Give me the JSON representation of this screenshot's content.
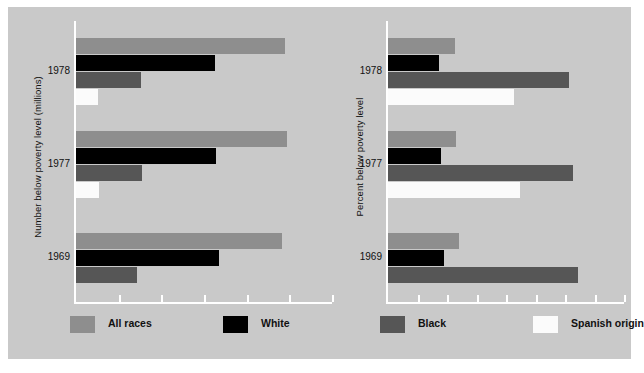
{
  "figure": {
    "background_color": "#c9c9c9",
    "border_color": "#ffffff"
  },
  "legend": {
    "items": [
      {
        "label": "All races",
        "key": "all-races",
        "color": "#8e8e8e"
      },
      {
        "label": "White",
        "key": "white",
        "color": "#000000"
      },
      {
        "label": "Black",
        "key": "black",
        "color": "#565656"
      },
      {
        "label": "Spanish origin",
        "key": "spanish",
        "color": "#fbfbfb"
      }
    ]
  },
  "panels": {
    "left": {
      "axis_title": "Number below poverty level (millions)",
      "year_labels": [
        "1978",
        "1977",
        "1969"
      ]
    },
    "right": {
      "axis_title": "Percent below poverty level",
      "year_labels": [
        "1978",
        "1977",
        "1969"
      ]
    }
  },
  "chart_data": [
    {
      "type": "bar",
      "orientation": "horizontal",
      "title": "",
      "panel": "left",
      "ylabel": "Number below poverty level (millions)",
      "xlabel": "",
      "categories": [
        "1978",
        "1977",
        "1969"
      ],
      "legend_position": "bottom",
      "grid": false,
      "xlim": [
        0,
        30
      ],
      "xticks": [
        0,
        5,
        10,
        15,
        20,
        25,
        30
      ],
      "series": [
        {
          "name": "All races",
          "color": "#8e8e8e",
          "values": [
            24.5,
            24.7,
            24.1
          ]
        },
        {
          "name": "White",
          "color": "#000000",
          "values": [
            16.3,
            16.4,
            16.7
          ]
        },
        {
          "name": "Black",
          "color": "#565656",
          "values": [
            7.6,
            7.7,
            7.1
          ]
        },
        {
          "name": "Spanish origin",
          "color": "#fbfbfb",
          "values": [
            2.6,
            2.7,
            null
          ]
        }
      ]
    },
    {
      "type": "bar",
      "orientation": "horizontal",
      "title": "",
      "panel": "right",
      "ylabel": "Percent below poverty level",
      "xlabel": "",
      "categories": [
        "1978",
        "1977",
        "1969"
      ],
      "legend_position": "bottom",
      "grid": false,
      "xlim": [
        0,
        40
      ],
      "xticks": [
        0,
        5,
        10,
        15,
        20,
        25,
        30,
        35,
        40
      ],
      "series": [
        {
          "name": "All races",
          "color": "#8e8e8e",
          "values": [
            11.4,
            11.6,
            12.1
          ]
        },
        {
          "name": "White",
          "color": "#000000",
          "values": [
            8.7,
            8.9,
            9.5
          ]
        },
        {
          "name": "Black",
          "color": "#565656",
          "values": [
            30.6,
            31.3,
            32.2
          ]
        },
        {
          "name": "Spanish origin",
          "color": "#fbfbfb",
          "values": [
            21.4,
            22.4,
            null
          ]
        }
      ]
    }
  ]
}
